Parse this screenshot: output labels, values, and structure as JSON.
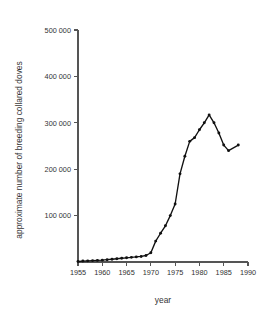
{
  "chart_data": {
    "type": "line",
    "title": "",
    "xlabel": "year",
    "ylabel": "approximate number of breeding collared doves",
    "xlim": [
      1955,
      1990
    ],
    "ylim": [
      0,
      500000
    ],
    "grid": false,
    "legend": "none",
    "xticks": [
      "1955",
      "1960",
      "1965",
      "1970",
      "1975",
      "1980",
      "1985",
      "1990"
    ],
    "xtick_values": [
      1955,
      1960,
      1965,
      1970,
      1975,
      1980,
      1985,
      1990
    ],
    "yticks": [
      "100 000",
      "200 000",
      "300 000",
      "400 000",
      "500 000"
    ],
    "ytick_values": [
      100000,
      200000,
      300000,
      400000,
      500000
    ],
    "series": [
      {
        "name": "approximate number of breeding collared doves",
        "marker": "filled-circle",
        "color": "#111111",
        "x": [
          1955,
          1956,
          1957,
          1958,
          1959,
          1960,
          1961,
          1962,
          1963,
          1964,
          1965,
          1966,
          1967,
          1968,
          1969,
          1970,
          1971,
          1972,
          1973,
          1974,
          1975,
          1976,
          1977,
          1978,
          1979,
          1980,
          1981,
          1982,
          1983,
          1984,
          1985,
          1986,
          1988
        ],
        "y": [
          1000,
          2000,
          2500,
          3000,
          3500,
          4000,
          5000,
          6000,
          7000,
          8000,
          9000,
          10000,
          11000,
          12000,
          14000,
          20000,
          45000,
          62000,
          78000,
          100000,
          125000,
          190000,
          228000,
          260000,
          268000,
          285000,
          300000,
          317000,
          300000,
          278000,
          252000,
          240000,
          252000
        ]
      }
    ]
  },
  "geometry": {
    "plot_left": 78,
    "plot_right": 248,
    "plot_top": 30,
    "plot_bottom": 262
  }
}
